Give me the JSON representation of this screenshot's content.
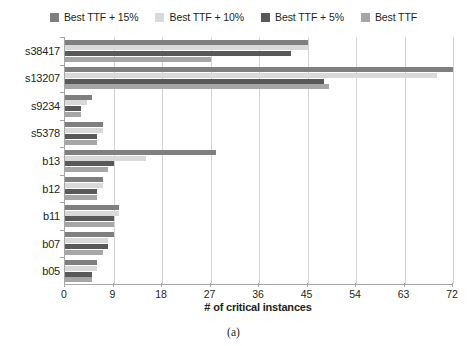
{
  "chart_data": {
    "type": "bar",
    "orientation": "horizontal",
    "title": "",
    "xlabel": "# of critical instances",
    "ylabel": "",
    "xlim": [
      0,
      72
    ],
    "xticks": [
      0,
      9,
      18,
      27,
      36,
      45,
      54,
      63,
      72
    ],
    "grid": true,
    "legend_position": "top",
    "categories": [
      "s38417",
      "s13207",
      "s9234",
      "s5378",
      "b13",
      "b12",
      "b11",
      "b07",
      "b05"
    ],
    "series": [
      {
        "name": "Best TTF + 15%",
        "color": "#7f7f7f",
        "values": [
          45,
          72,
          5,
          7,
          28,
          7,
          10,
          9,
          6
        ]
      },
      {
        "name": "Best TTF + 10%",
        "color": "#d9d9d9",
        "values": [
          45,
          69,
          4,
          7,
          15,
          7,
          10,
          8,
          6
        ]
      },
      {
        "name": "Best TTF + 5%",
        "color": "#595959",
        "values": [
          42,
          48,
          3,
          6,
          9,
          6,
          9,
          8,
          5
        ]
      },
      {
        "name": "Best TTF",
        "color": "#a6a6a6",
        "values": [
          27,
          49,
          3,
          6,
          8,
          6,
          9,
          7,
          5
        ]
      }
    ]
  },
  "caption": "(a)",
  "axis": {
    "gridline_color": "#d3d3d3",
    "axis_color": "#a6a6a6"
  }
}
